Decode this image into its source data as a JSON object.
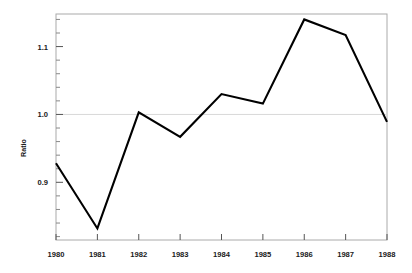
{
  "chart_data": {
    "type": "line",
    "title": "",
    "subtitle": "",
    "xlabel": "",
    "ylabel": "Ratio",
    "x": [
      1980,
      1981,
      1982,
      1983,
      1984,
      1985,
      1986,
      1987,
      1988
    ],
    "categories": [
      "1980",
      "1981",
      "1982",
      "1983",
      "1984",
      "1985",
      "1986",
      "1987",
      "1988"
    ],
    "values": [
      0.928,
      0.832,
      1.003,
      0.967,
      1.03,
      1.016,
      1.14,
      1.117,
      0.989
    ],
    "series": [
      {
        "name": "Ratio",
        "values": [
          0.928,
          0.832,
          1.003,
          0.967,
          1.03,
          1.016,
          1.14,
          1.117,
          0.989
        ]
      }
    ],
    "xlim": [
      1980,
      1988
    ],
    "ylim": [
      0.815,
      1.148
    ],
    "grid": false,
    "legend": null,
    "legend_position": "none",
    "reference_lines": [
      {
        "axis": "y",
        "value": 1.0,
        "color": "#d0d0d0"
      }
    ],
    "line_color": "#000000",
    "frame_color": "#aaaaaa",
    "annotations": []
  },
  "axes": {
    "y_tick_labels": [
      "1.1",
      "1.0",
      "0.9"
    ],
    "y_tick_values": [
      1.1,
      1.0,
      0.9
    ],
    "y_minor_tick_values": [
      1.14,
      1.12,
      1.08,
      1.06,
      1.04,
      1.02,
      0.98,
      0.96,
      0.94,
      0.92,
      0.88,
      0.86,
      0.84,
      0.82
    ],
    "x_tick_labels": [
      "1980",
      "1981",
      "1982",
      "1983",
      "1984",
      "1985",
      "1986",
      "1987",
      "1988"
    ],
    "x_tick_values": [
      1980,
      1981,
      1982,
      1983,
      1984,
      1985,
      1986,
      1987,
      1988
    ],
    "y_axis_title": "Ratio"
  },
  "colors": {
    "background": "#ffffff",
    "line": "#000000",
    "frame": "#aaaaaa",
    "reference_line": "#d8d8d8",
    "text": "#1a1a1a"
  }
}
